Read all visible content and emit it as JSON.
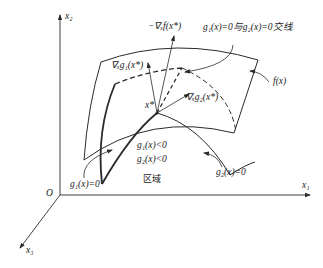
{
  "diagram": {
    "axes": {
      "x1": "x₁",
      "x2": "x₂",
      "x3": "x₃",
      "origin": "O"
    },
    "labels": {
      "neg_grad_f": "−∇ₓf(x*)",
      "intersection": "g₁(x)=0与g₂(x)=0交线",
      "grad_g1": "∇ₓg₁(x*)",
      "grad_g2": "∇ₓg₂(x*)",
      "f": "f(x)",
      "xstar": "x*",
      "g1_lt": "g₁(x)<0",
      "g2_lt": "g₂(x)<0",
      "region": "区域",
      "g1_eq": "g₁(x)=0",
      "g2_eq": "g₂(x)=0"
    },
    "colors": {
      "line": "#2a2a2a",
      "background": "#ffffff"
    }
  }
}
